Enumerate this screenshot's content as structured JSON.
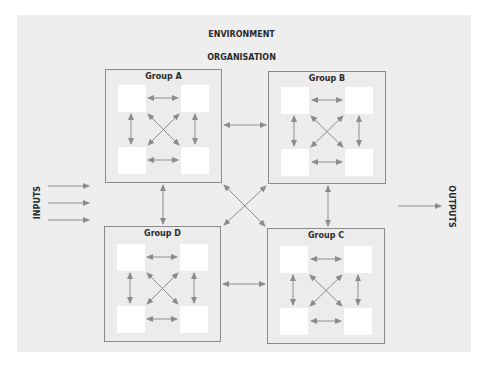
{
  "diagram": {
    "environment_label": "ENVIRONMENT",
    "organisation_label": "ORGANISATION",
    "inputs_label": "INPUTS",
    "outputs_label": "OUTPUTS",
    "groups": [
      {
        "id": "A",
        "label": "Group A",
        "members": 4
      },
      {
        "id": "B",
        "label": "Group B",
        "members": 4
      },
      {
        "id": "C",
        "label": "Group C",
        "members": 4
      },
      {
        "id": "D",
        "label": "Group D",
        "members": 4
      }
    ],
    "connections": [
      "Group A <-> Group B",
      "Group A <-> Group D",
      "Group B <-> Group C",
      "Group D <-> Group C",
      "Group A <-> Group C",
      "Group B <-> Group D"
    ],
    "input_arrows": 3,
    "output_arrows": 1,
    "colors": {
      "panel": "#eeeeee",
      "border": "#8a8a8a",
      "arrow": "#8c8c8c",
      "member_box": "#ffffff",
      "text": "#2a2a2a"
    }
  }
}
